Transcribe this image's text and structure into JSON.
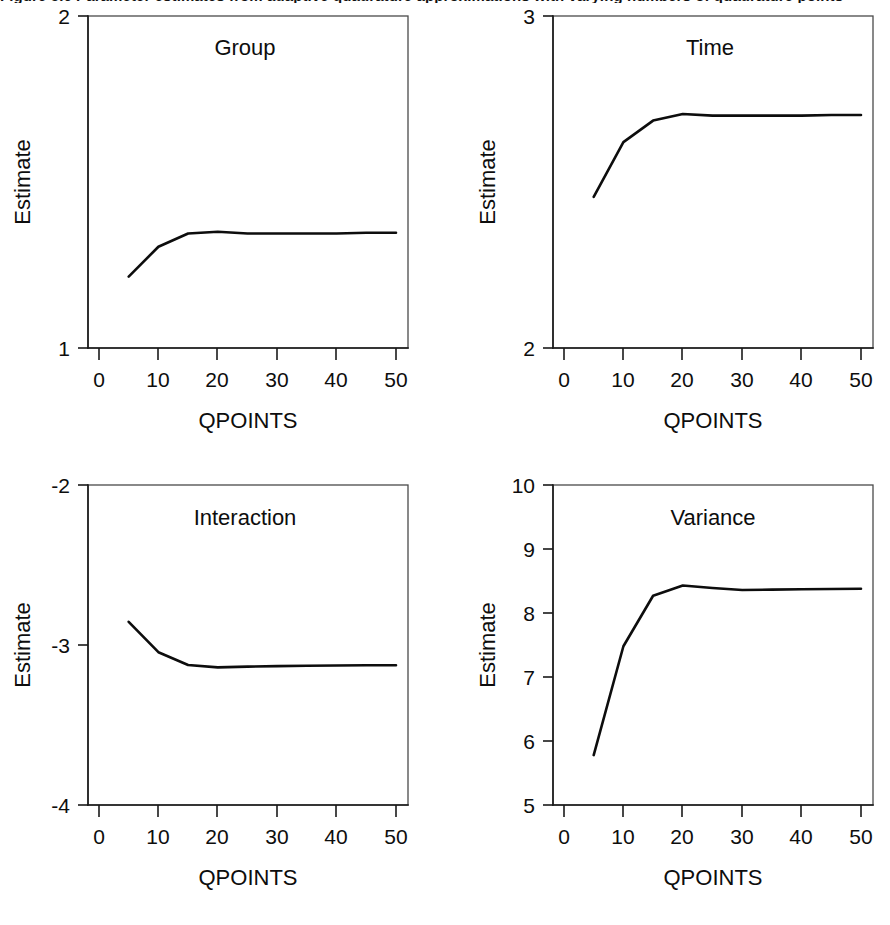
{
  "figure": {
    "caption_remnant": "Figure 5.6  Parameter estimates from adaptive quadrature approximations with varying numbers of quadrature points",
    "background_color": "#ffffff",
    "line_color": "#0d0d0d",
    "axis_color": "#1a1a1a"
  },
  "chart_data": [
    {
      "type": "line",
      "title": "Group",
      "xlabel": "QPOINTS",
      "ylabel": "Estimate",
      "xlim": [
        0,
        52
      ],
      "ylim": [
        1,
        2
      ],
      "xticks": [
        0,
        10,
        20,
        30,
        40,
        50
      ],
      "xticklabels": [
        "0",
        "10",
        "20",
        "30",
        "40",
        "50"
      ],
      "yticks": [
        1,
        2
      ],
      "yticklabels": [
        "1",
        "2"
      ],
      "grid": false,
      "legend": "none",
      "x": [
        5,
        10,
        15,
        20,
        25,
        30,
        35,
        40,
        45,
        50
      ],
      "values": [
        1.215,
        1.305,
        1.345,
        1.35,
        1.345,
        1.345,
        1.345,
        1.345,
        1.347,
        1.347
      ]
    },
    {
      "type": "line",
      "title": "Time",
      "xlabel": "QPOINTS",
      "ylabel": "Estimate",
      "xlim": [
        0,
        52
      ],
      "ylim": [
        2,
        3
      ],
      "xticks": [
        0,
        10,
        20,
        30,
        40,
        50
      ],
      "xticklabels": [
        "0",
        "10",
        "20",
        "30",
        "40",
        "50"
      ],
      "yticks": [
        2,
        3
      ],
      "yticklabels": [
        "2",
        "3"
      ],
      "grid": false,
      "legend": "none",
      "x": [
        5,
        10,
        15,
        20,
        25,
        30,
        35,
        40,
        45,
        50
      ],
      "values": [
        2.455,
        2.62,
        2.685,
        2.705,
        2.7,
        2.7,
        2.7,
        2.7,
        2.702,
        2.702
      ]
    },
    {
      "type": "line",
      "title": "Interaction",
      "xlabel": "QPOINTS",
      "ylabel": "Estimate",
      "xlim": [
        0,
        52
      ],
      "ylim": [
        -4,
        -2
      ],
      "xticks": [
        0,
        10,
        20,
        30,
        40,
        50
      ],
      "xticklabels": [
        "0",
        "10",
        "20",
        "30",
        "40",
        "50"
      ],
      "yticks": [
        -4,
        -3,
        -2
      ],
      "yticklabels": [
        "-4",
        "-3",
        "-2"
      ],
      "grid": false,
      "legend": "none",
      "x": [
        5,
        10,
        15,
        20,
        25,
        30,
        35,
        40,
        45,
        50
      ],
      "values": [
        -2.855,
        -3.045,
        -3.125,
        -3.14,
        -3.135,
        -3.132,
        -3.13,
        -3.128,
        -3.127,
        -3.127
      ]
    },
    {
      "type": "line",
      "title": "Variance",
      "xlabel": "QPOINTS",
      "ylabel": "Estimate",
      "xlim": [
        0,
        52
      ],
      "ylim": [
        5,
        10
      ],
      "xticks": [
        0,
        10,
        20,
        30,
        40,
        50
      ],
      "xticklabels": [
        "0",
        "10",
        "20",
        "30",
        "40",
        "50"
      ],
      "yticks": [
        5,
        6,
        7,
        8,
        9,
        10
      ],
      "yticklabels": [
        "5",
        "6",
        "7",
        "8",
        "9",
        "10"
      ],
      "grid": false,
      "legend": "none",
      "x": [
        5,
        10,
        15,
        20,
        25,
        30,
        35,
        40,
        45,
        50
      ],
      "values": [
        5.78,
        7.48,
        8.27,
        8.43,
        8.39,
        8.36,
        8.365,
        8.37,
        8.375,
        8.38
      ]
    }
  ],
  "panels": {
    "group": {
      "title": "Group",
      "xlabel": "QPOINTS",
      "ylabel": "Estimate",
      "ytick_top": "2",
      "ytick_bottom": "1"
    },
    "time": {
      "title": "Time",
      "xlabel": "QPOINTS",
      "ylabel": "Estimate",
      "ytick_top": "3",
      "ytick_bottom": "2"
    },
    "interaction": {
      "title": "Interaction",
      "xlabel": "QPOINTS",
      "ylabel": "Estimate",
      "ytick_top": "-2",
      "ytick_mid": "-3",
      "ytick_bottom": "-4"
    },
    "variance": {
      "title": "Variance",
      "xlabel": "QPOINTS",
      "ylabel": "Estimate",
      "ytick_10": "10",
      "ytick_9": "9",
      "ytick_8": "8",
      "ytick_7": "7",
      "ytick_6": "6",
      "ytick_5": "5"
    }
  },
  "xaxis_labels": {
    "t0": "0",
    "t10": "10",
    "t20": "20",
    "t30": "30",
    "t40": "40",
    "t50": "50"
  }
}
